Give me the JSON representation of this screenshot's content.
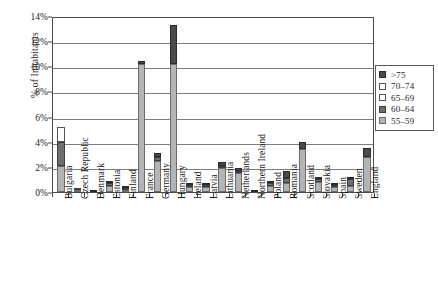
{
  "chart_data": {
    "type": "bar",
    "stacked": true,
    "title": "",
    "xlabel": "",
    "ylabel": "% of Inhabitants",
    "ylim": [
      0,
      14
    ],
    "yticks": [
      0,
      2,
      4,
      6,
      8,
      10,
      12,
      14
    ],
    "ytick_labels": [
      "0%",
      "2%",
      "4%",
      "6%",
      "8%",
      "10%",
      "12%",
      "14%"
    ],
    "grid": true,
    "legend_position": "right",
    "categories": [
      "Bulgaria",
      "Czech Republic",
      "Denmark",
      "Estonia",
      "Finland",
      "France",
      "Germany",
      "Hungary",
      "Ireland",
      "Latvia",
      "Lithuania",
      "Netherlands",
      "Northern Ireland",
      "Poland",
      "Romania",
      "Scotland",
      "Slovakia",
      "Spain",
      "Sweden",
      "England"
    ],
    "series": [
      {
        "name": "55–59",
        "key": "s55",
        "color": "#b4b4b4",
        "values": [
          2.1,
          0.1,
          0.0,
          0.5,
          0.1,
          10.2,
          2.5,
          10.2,
          0.4,
          0.4,
          1.9,
          1.5,
          0.0,
          0.5,
          0.7,
          3.4,
          0.8,
          0.4,
          0.5,
          2.8
        ]
      },
      {
        "name": "60–64",
        "key": "s60",
        "color": "#6e6e6e",
        "values": [
          1.9,
          0.05,
          0.0,
          0.25,
          0.1,
          0.0,
          0.3,
          0.0,
          0.1,
          0.15,
          0.2,
          0.2,
          0.0,
          0.2,
          0.4,
          0.0,
          0.2,
          0.1,
          0.5,
          0.0
        ]
      },
      {
        "name": "65–69",
        "key": "s65",
        "color": "#ffffff",
        "values": [
          1.2,
          0.0,
          0.0,
          0.0,
          0.0,
          0.0,
          0.0,
          0.0,
          0.0,
          0.0,
          0.0,
          0.0,
          0.0,
          0.0,
          0.0,
          0.0,
          0.0,
          0.0,
          0.0,
          0.0
        ]
      },
      {
        "name": "70–74",
        "key": "s70",
        "color": "#ffffff",
        "values": [
          0.0,
          0.0,
          0.0,
          0.0,
          0.0,
          0.0,
          0.0,
          0.0,
          0.0,
          0.0,
          0.0,
          0.0,
          0.0,
          0.0,
          0.0,
          0.0,
          0.0,
          0.0,
          0.0,
          0.0
        ]
      },
      {
        "name": ">75",
        "key": "s75",
        "color": "#4a4a4a",
        "values": [
          0.0,
          0.0,
          0.1,
          0.05,
          0.05,
          0.25,
          0.3,
          3.1,
          0.05,
          0.05,
          0.3,
          0.2,
          0.1,
          0.2,
          0.6,
          0.6,
          0.1,
          0.1,
          0.1,
          0.7
        ]
      }
    ],
    "totals": [
      5.2,
      0.15,
      0.1,
      0.8,
      0.25,
      10.45,
      3.1,
      13.3,
      0.55,
      0.6,
      2.4,
      1.9,
      0.1,
      0.9,
      1.7,
      4.0,
      1.1,
      0.6,
      1.1,
      3.5
    ]
  },
  "legend": {
    "items": [
      {
        "label": ">75",
        "key": "s75"
      },
      {
        "label": "70–74",
        "key": "s70"
      },
      {
        "label": "65–69",
        "key": "s65"
      },
      {
        "label": "60–64",
        "key": "s60"
      },
      {
        "label": "55–59",
        "key": "s55"
      }
    ]
  }
}
